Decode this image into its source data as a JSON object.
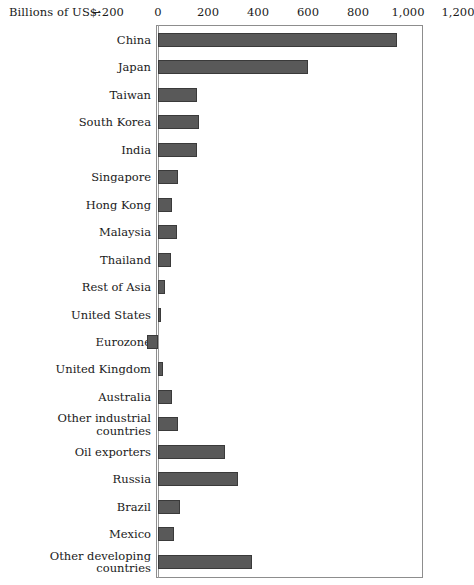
{
  "axis": {
    "title": "Billions of US$:",
    "tick_labels": [
      "−200",
      "0",
      "200",
      "400",
      "600",
      "800",
      "1,000",
      "1,200"
    ],
    "tick_values": [
      -200,
      0,
      200,
      400,
      600,
      800,
      1000,
      1200
    ],
    "xlim": [
      -268,
      1200
    ]
  },
  "style": {
    "bar_fill": "#595959",
    "bar_stroke": "#3a3a3a",
    "frame_color": "#8d8d8d",
    "text_color": "#1a1a1a"
  },
  "chart_data": {
    "type": "bar",
    "orientation": "horizontal",
    "title": "",
    "subtitle": "",
    "xlabel": "Billions of US$:",
    "ylabel": "",
    "xlim": [
      -268,
      1200
    ],
    "xticks": [
      -200,
      0,
      200,
      400,
      600,
      800,
      1000,
      1200
    ],
    "xtick_labels": [
      "−200",
      "0",
      "200",
      "400",
      "600",
      "800",
      "1,000",
      "1,200"
    ],
    "grid": false,
    "legend": false,
    "categories": [
      "China",
      "Japan",
      "Taiwan",
      "South Korea",
      "India",
      "Singapore",
      "Hong Kong",
      "Malaysia",
      "Thailand",
      "Rest of Asia",
      "United States",
      "Eurozone",
      "United Kingdom",
      "Australia",
      "Other industrial\ncountries",
      "Oil exporters",
      "Russia",
      "Brazil",
      "Mexico",
      "Other developing\ncountries"
    ],
    "values": [
      956,
      600,
      156,
      164,
      156,
      80,
      56,
      76,
      52,
      28,
      12,
      -44,
      20,
      56,
      80,
      268,
      320,
      88,
      64,
      376
    ]
  }
}
